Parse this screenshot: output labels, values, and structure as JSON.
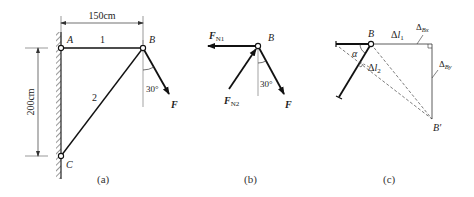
{
  "figure": {
    "panels": [
      {
        "id": "a",
        "caption": "(a)",
        "points": {
          "A": "A",
          "B": "B",
          "C": "C"
        },
        "members": [
          {
            "label": "1"
          },
          {
            "label": "2"
          }
        ],
        "dimensions": {
          "horizontal": "150cm",
          "vertical": "200cm"
        },
        "force": "F",
        "angle": "30°"
      },
      {
        "id": "b",
        "caption": "(b)",
        "point": "B",
        "forces": {
          "fn1_main": "F",
          "fn1_sub": "N1",
          "fn2_main": "F",
          "fn2_sub": "N2",
          "f": "F"
        },
        "angle": "30°"
      },
      {
        "id": "c",
        "caption": "(c)",
        "point": "B",
        "point_displaced": "B′",
        "angle": "α",
        "dl1_main": "Δ",
        "dl1_var": "l",
        "dl1_sub": "1",
        "dl2_main": "Δ",
        "dl2_var": "l",
        "dl2_sub": "2",
        "dbx_main": "Δ",
        "dbx_sub": "Bx",
        "dby_main": "Δ",
        "dby_sub": "By"
      }
    ]
  },
  "colors": {
    "ink": "#222222",
    "background": "#ffffff"
  }
}
